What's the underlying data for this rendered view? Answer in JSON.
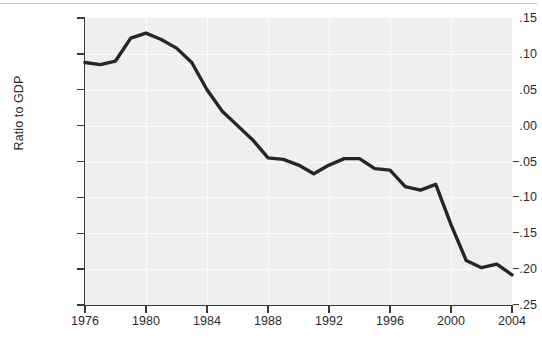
{
  "figure": {
    "background_color": "#ffffff",
    "plot_background_color": "#efefef",
    "line_color": "#262626",
    "axis_color": "#3a3a3a",
    "grid_color": "#fcfcfc",
    "caption_remnant": "",
    "axis_title_y": "Ratio to GDP"
  },
  "chart_data": {
    "type": "line",
    "title": "",
    "subtitle": "",
    "xlabel": "",
    "ylabel": "Ratio to GDP",
    "xlim": [
      1976,
      2004
    ],
    "ylim": [
      -0.25,
      0.15
    ],
    "grid": true,
    "legend": false,
    "legend_position": "none",
    "annotations": [],
    "ytick_labels": [
      ".15",
      ".10",
      ".05",
      ".00",
      "-.05",
      "-.10",
      "-.15",
      "-.20",
      "-.25"
    ],
    "ytick_values": [
      0.15,
      0.1,
      0.05,
      0.0,
      -0.05,
      -0.1,
      -0.15,
      -0.2,
      -0.25
    ],
    "xtick_labels": [
      "1976",
      "1980",
      "1984",
      "1988",
      "1992",
      "1996",
      "2000",
      "2004"
    ],
    "xtick_values": [
      1976,
      1980,
      1984,
      1988,
      1992,
      1996,
      2000,
      2004
    ],
    "x": [
      1976,
      1977,
      1978,
      1979,
      1980,
      1981,
      1982,
      1983,
      1984,
      1985,
      1986,
      1987,
      1988,
      1989,
      1990,
      1991,
      1992,
      1993,
      1994,
      1995,
      1996,
      1997,
      1998,
      1999,
      2000,
      2001,
      2002,
      2003,
      2004
    ],
    "series": [
      {
        "name": "Ratio to GDP",
        "values": [
          0.088,
          0.085,
          0.09,
          0.122,
          0.129,
          0.12,
          0.108,
          0.088,
          0.05,
          0.02,
          0.0,
          -0.02,
          -0.045,
          -0.047,
          -0.055,
          -0.067,
          -0.055,
          -0.046,
          -0.046,
          -0.06,
          -0.062,
          -0.085,
          -0.09,
          -0.082,
          -0.138,
          -0.188,
          -0.198,
          -0.193,
          -0.208
        ]
      }
    ]
  }
}
